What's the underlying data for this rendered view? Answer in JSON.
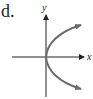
{
  "figure": {
    "option_label": "d.",
    "x_axis_label": "x",
    "y_axis_label": "y",
    "curve": "parabola opening right (x = y^2)",
    "colors": {
      "axis": "#222222",
      "curve": "#6b6b6b"
    }
  }
}
